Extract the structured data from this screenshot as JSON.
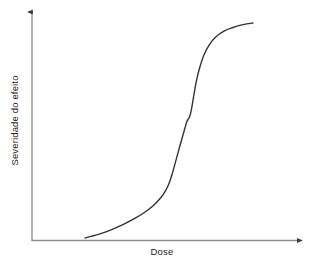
{
  "chart_data": {
    "type": "line",
    "title": "",
    "subtitle": "",
    "xlabel": "Dose",
    "ylabel": "Severidade do efeito",
    "legend": [],
    "annotations": [],
    "grid": false,
    "legend_position": "none",
    "axis_style": "arrow-headed open axes, no tick marks, no tick labels",
    "xlim": [
      0,
      1
    ],
    "ylim": [
      0,
      1
    ],
    "x_ticklabels": [],
    "y_ticklabels": [],
    "series": [
      {
        "name": "curva dose-resposta sigmoide",
        "color": "#333333",
        "linewidth": 1.4,
        "x": [
          0.19,
          0.25,
          0.31,
          0.37,
          0.43,
          0.48,
          0.52,
          0.55,
          0.57,
          0.59,
          0.61,
          0.63,
          0.65,
          0.665,
          0.675,
          0.682,
          0.688,
          0.694,
          0.7,
          0.706,
          0.712,
          0.72,
          0.73,
          0.745,
          0.765,
          0.79,
          0.82,
          0.86,
          0.9,
          0.94,
          0.97,
          1.0
        ],
        "y": [
          0.005,
          0.02,
          0.04,
          0.065,
          0.095,
          0.125,
          0.155,
          0.185,
          0.21,
          0.245,
          0.3,
          0.37,
          0.44,
          0.49,
          0.525,
          0.545,
          0.555,
          0.565,
          0.585,
          0.615,
          0.65,
          0.695,
          0.745,
          0.8,
          0.855,
          0.9,
          0.935,
          0.962,
          0.978,
          0.99,
          0.996,
          1.0
        ]
      }
    ]
  },
  "axes": {
    "x_axis_name": "Dose",
    "y_axis_name": "Severidade do efeito",
    "line_color": "#8c8c8c",
    "arrow_color": "#404040"
  },
  "labels": {
    "x": "Dose",
    "y": "Severidade do efeito"
  },
  "colors": {
    "background": "#ffffff",
    "curve": "#333333",
    "axis": "#8c8c8c",
    "text": "#262626"
  }
}
